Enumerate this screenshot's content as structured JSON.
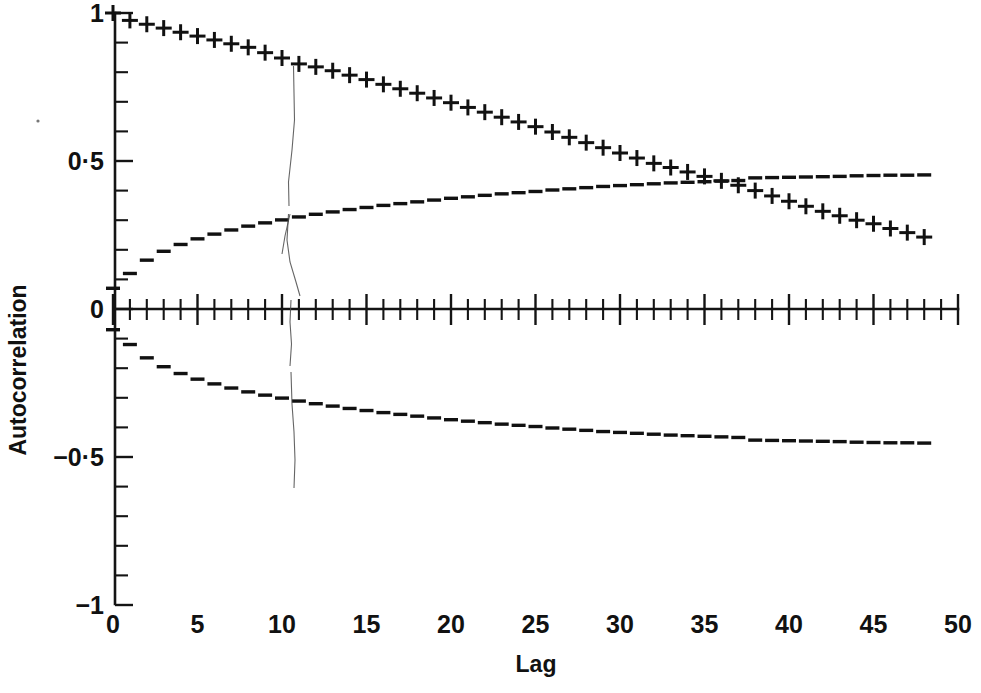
{
  "chart_data": {
    "type": "line",
    "title": "",
    "subtitle": "",
    "xlabel": "Lag",
    "ylabel": "Autocorrelation",
    "xlim": [
      0,
      50
    ],
    "ylim": [
      -1,
      1
    ],
    "grid": false,
    "legend": "none",
    "x_tick_labels": [
      "0",
      "5",
      "10",
      "15",
      "20",
      "25",
      "30",
      "35",
      "40",
      "45",
      "50"
    ],
    "x_tick_values": [
      0,
      5,
      10,
      15,
      20,
      25,
      30,
      35,
      40,
      45,
      50
    ],
    "x_minor_tick_step": 1,
    "y_tick_labels": [
      "1",
      "0·5",
      "0",
      "−0·5",
      "−1"
    ],
    "y_tick_values": [
      1,
      0.5,
      0,
      -0.5,
      -1
    ],
    "y_minor_tick_step": 0.1,
    "x": [
      0,
      1,
      2,
      3,
      4,
      5,
      6,
      7,
      8,
      9,
      10,
      11,
      12,
      13,
      14,
      15,
      16,
      17,
      18,
      19,
      20,
      21,
      22,
      23,
      24,
      25,
      26,
      27,
      28,
      29,
      30,
      31,
      32,
      33,
      34,
      35,
      36,
      37,
      38,
      39,
      40,
      41,
      42,
      43,
      44,
      45,
      46,
      47,
      48
    ],
    "series": [
      {
        "name": "autocorrelation",
        "marker": "plus",
        "linestyle": "none",
        "color": "#111111",
        "values": [
          1.0,
          0.975,
          0.962,
          0.949,
          0.935,
          0.922,
          0.909,
          0.896,
          0.884,
          0.866,
          0.848,
          0.828,
          0.818,
          0.805,
          0.79,
          0.775,
          0.759,
          0.744,
          0.729,
          0.713,
          0.697,
          0.681,
          0.665,
          0.648,
          0.632,
          0.616,
          0.598,
          0.58,
          0.562,
          0.545,
          0.527,
          0.51,
          0.492,
          0.478,
          0.463,
          0.448,
          0.433,
          0.418,
          0.4,
          0.382,
          0.364,
          0.347,
          0.33,
          0.315,
          0.3,
          0.288,
          0.272,
          0.258,
          0.243
        ]
      },
      {
        "name": "upper-confidence-bound",
        "marker": "dash",
        "linestyle": "dashed",
        "color": "#111111",
        "values": [
          0.07,
          0.12,
          0.165,
          0.195,
          0.218,
          0.237,
          0.253,
          0.267,
          0.28,
          0.291,
          0.301,
          0.311,
          0.32,
          0.328,
          0.336,
          0.343,
          0.35,
          0.356,
          0.362,
          0.368,
          0.374,
          0.379,
          0.384,
          0.389,
          0.393,
          0.397,
          0.402,
          0.406,
          0.41,
          0.414,
          0.417,
          0.42,
          0.423,
          0.426,
          0.428,
          0.43,
          0.432,
          0.434,
          0.443,
          0.444,
          0.445,
          0.446,
          0.447,
          0.448,
          0.45,
          0.451,
          0.452,
          0.452,
          0.453
        ]
      },
      {
        "name": "lower-confidence-bound",
        "marker": "dash",
        "linestyle": "dashed",
        "color": "#111111",
        "values": [
          -0.07,
          -0.12,
          -0.165,
          -0.195,
          -0.218,
          -0.237,
          -0.253,
          -0.267,
          -0.28,
          -0.291,
          -0.301,
          -0.311,
          -0.32,
          -0.328,
          -0.336,
          -0.343,
          -0.35,
          -0.356,
          -0.362,
          -0.368,
          -0.374,
          -0.379,
          -0.384,
          -0.389,
          -0.393,
          -0.397,
          -0.402,
          -0.406,
          -0.41,
          -0.414,
          -0.417,
          -0.42,
          -0.423,
          -0.426,
          -0.428,
          -0.43,
          -0.432,
          -0.434,
          -0.443,
          -0.444,
          -0.445,
          -0.446,
          -0.447,
          -0.448,
          -0.45,
          -0.451,
          -0.452,
          -0.452,
          -0.453
        ]
      }
    ],
    "annotations": [
      {
        "name": "scan-fold-artifact",
        "description": "faint vertical scan line near lag 11"
      },
      {
        "name": "speck-artifact",
        "description": "small dust speck left of axis"
      }
    ]
  },
  "axes": {
    "x_title": "Lag",
    "y_title": "Autocorrelation"
  }
}
